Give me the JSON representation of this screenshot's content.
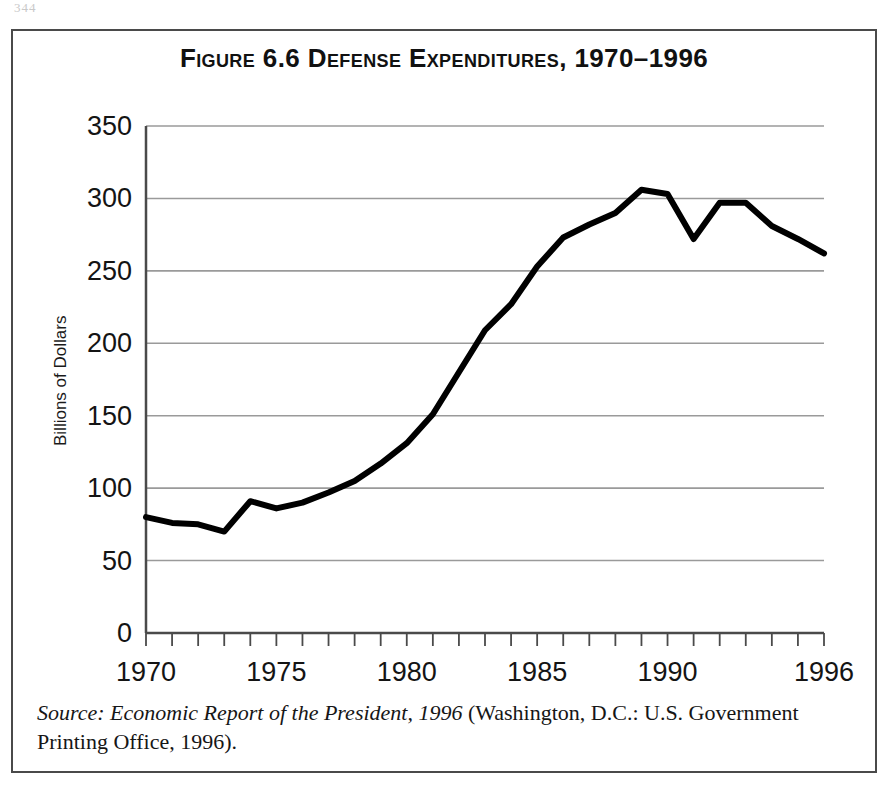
{
  "page": {
    "corner_marker": "344"
  },
  "figure": {
    "title": "Figure 6.6  Defense Expenditures, 1970–1996",
    "source_italic": "Source: Economic Report of the President, 1996",
    "source_rest": " (Washington, D.C.: U.S. Government Printing Office, 1996)."
  },
  "chart_data": {
    "type": "line",
    "title": "Figure 6.6  Defense Expenditures, 1970–1996",
    "subtitle": "",
    "xlabel": "",
    "ylabel": "Billions of Dollars",
    "x": [
      1970,
      1971,
      1972,
      1973,
      1974,
      1975,
      1976,
      1977,
      1978,
      1979,
      1980,
      1981,
      1982,
      1983,
      1984,
      1985,
      1986,
      1987,
      1988,
      1989,
      1990,
      1991,
      1992,
      1993,
      1994,
      1995,
      1996
    ],
    "values": [
      80,
      76,
      75,
      70,
      91,
      86,
      90,
      97,
      105,
      117,
      131,
      151,
      180,
      209,
      227,
      253,
      273,
      282,
      290,
      306,
      303,
      272,
      297,
      297,
      281,
      272,
      262
    ],
    "series": [
      {
        "name": "Defense Expenditures",
        "values": [
          80,
          76,
          75,
          70,
          91,
          86,
          90,
          97,
          105,
          117,
          131,
          151,
          180,
          209,
          227,
          253,
          273,
          282,
          290,
          306,
          303,
          272,
          297,
          297,
          281,
          272,
          262
        ]
      }
    ],
    "xlim": [
      1970,
      1996
    ],
    "ylim": [
      0,
      350
    ],
    "y_ticks": [
      0,
      50,
      100,
      150,
      200,
      250,
      300,
      350
    ],
    "y_tick_labels": [
      "0",
      "50",
      "100",
      "150",
      "200",
      "250",
      "300",
      "350"
    ],
    "x_ticks": [
      1970,
      1971,
      1972,
      1973,
      1974,
      1975,
      1976,
      1977,
      1978,
      1979,
      1980,
      1981,
      1982,
      1983,
      1984,
      1985,
      1986,
      1987,
      1988,
      1989,
      1990,
      1991,
      1992,
      1993,
      1994,
      1995,
      1996
    ],
    "x_tick_labels": [
      "1970",
      "1975",
      "1980",
      "1985",
      "1990",
      "1996"
    ],
    "x_labeled_years": [
      1970,
      1975,
      1980,
      1985,
      1990,
      1996
    ],
    "grid": true,
    "grid_axis": "y",
    "legend": false,
    "legend_position": "none",
    "line_color": "#000000",
    "line_width": 6,
    "grid_color": "#9a9a9a",
    "axis_color": "#4a4a4a",
    "background": "#ffffff"
  }
}
